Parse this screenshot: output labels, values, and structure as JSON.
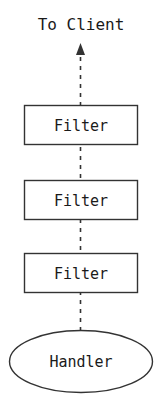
{
  "diagram": {
    "title": "To Client",
    "canvas": {
      "width": 163,
      "height": 410,
      "background": "#ffffff"
    },
    "stroke_color": "#333333",
    "text_color": "#1a1a1a",
    "flow": {
      "direction": "upward",
      "style": "dashed",
      "arrow_name": "to-client-arrow"
    },
    "nodes": [
      {
        "id": "filter-1",
        "shape": "rectangle",
        "label": "Filter"
      },
      {
        "id": "filter-2",
        "shape": "rectangle",
        "label": "Filter"
      },
      {
        "id": "filter-3",
        "shape": "rectangle",
        "label": "Filter"
      },
      {
        "id": "handler",
        "shape": "ellipse",
        "label": "Handler"
      }
    ]
  }
}
